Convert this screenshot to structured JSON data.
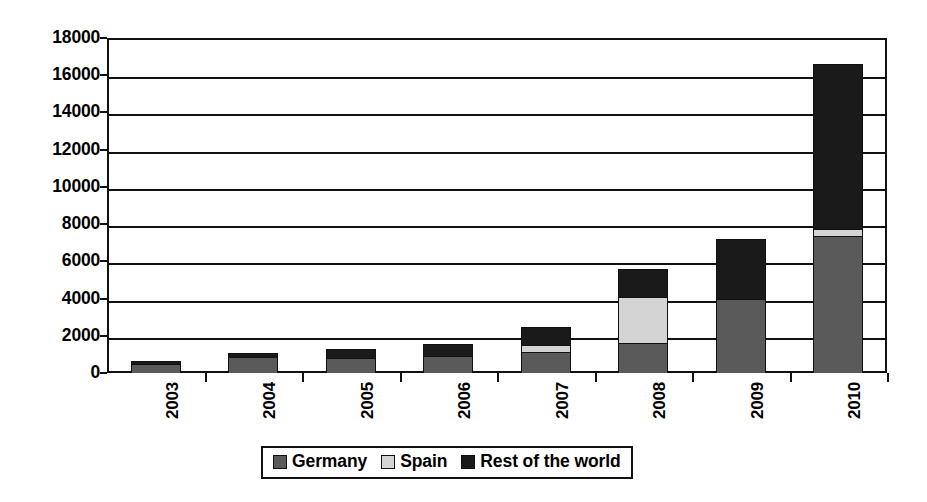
{
  "chart_data": {
    "type": "bar",
    "subtype": "stacked-column",
    "title": "",
    "subtitle": "",
    "xlabel": "",
    "ylabel": "",
    "categories": [
      "2003",
      "2004",
      "2005",
      "2006",
      "2007",
      "2008",
      "2009",
      "2010"
    ],
    "series": [
      {
        "name": "Germany",
        "color": "#5a5a5a",
        "values": [
          500,
          850,
          800,
          900,
          1150,
          1600,
          4000,
          7350
        ]
      },
      {
        "name": "Spain",
        "color": "#d4d4d4",
        "values": [
          0,
          0,
          0,
          0,
          350,
          2500,
          0,
          400
        ]
      },
      {
        "name": "Rest of the world",
        "color": "#1a1a1a",
        "values": [
          150,
          250,
          500,
          650,
          950,
          1500,
          3200,
          8850
        ]
      }
    ],
    "totals": [
      650,
      1100,
      1300,
      1550,
      2450,
      5600,
      7200,
      16600
    ],
    "ylim": [
      0,
      18000
    ],
    "ytick_step": 2000,
    "yticks": [
      "0",
      "2000",
      "4000",
      "6000",
      "8000",
      "10000",
      "12000",
      "14000",
      "16000",
      "18000"
    ],
    "grid": true,
    "grid_axis": "y",
    "legend_position": "bottom",
    "legend": [
      "Germany",
      "Spain",
      "Rest of the world"
    ],
    "stacked": true,
    "annotations": []
  },
  "style": {
    "axis_color": "#111111",
    "background": "#ffffff",
    "plot_background": "#ffffff"
  }
}
